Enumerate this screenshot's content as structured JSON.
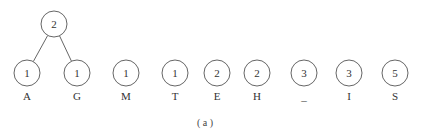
{
  "caption": "( a )",
  "root": {
    "weight": "2",
    "children": [
      0,
      1
    ]
  },
  "nodes": [
    {
      "weight": "1",
      "label": "A"
    },
    {
      "weight": "1",
      "label": "G"
    },
    {
      "weight": "1",
      "label": "M"
    },
    {
      "weight": "1",
      "label": "T"
    },
    {
      "weight": "2",
      "label": "E"
    },
    {
      "weight": "2",
      "label": "H"
    },
    {
      "weight": "3",
      "label": "_"
    },
    {
      "weight": "3",
      "label": "I"
    },
    {
      "weight": "5",
      "label": "S"
    }
  ]
}
